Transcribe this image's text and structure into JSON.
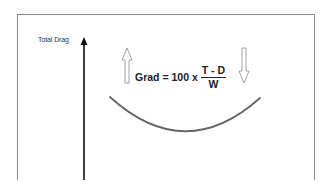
{
  "diagram": {
    "axis": {
      "label": "Total Drag",
      "color": "#111111"
    },
    "formula": {
      "lhs": "Grad = 100 x",
      "numerator": "T - D",
      "denominator": "W"
    },
    "arrows": [
      {
        "name": "up-arrow",
        "direction": "up",
        "style": "hollow"
      },
      {
        "name": "down-arrow",
        "direction": "down",
        "style": "hollow"
      }
    ],
    "curve": {
      "shape": "u-shaped",
      "color": "#666666"
    },
    "frame": {
      "color": "#8a8a8a"
    }
  }
}
